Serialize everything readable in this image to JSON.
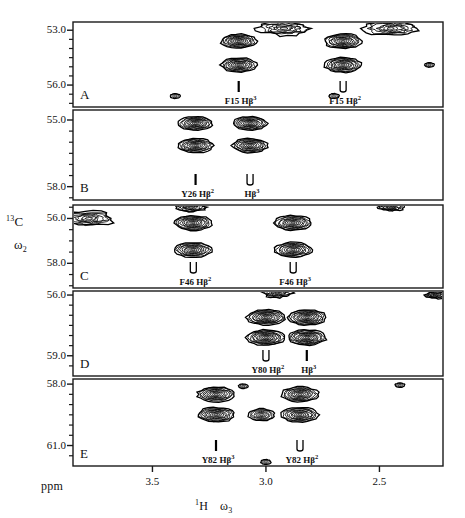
{
  "figure": {
    "type": "nmr-2d-contour-strips",
    "ppm_label": "ppm",
    "yaxis": {
      "nucleus": "13C",
      "omega": "2",
      "text_main": "C",
      "text_sup": "13",
      "text_omega": "ω",
      "text_omega_sub": "2"
    },
    "xaxis": {
      "nucleus": "1H",
      "omega": "3",
      "text_main": "H",
      "text_sup": "1",
      "text_omega": "ω",
      "text_omega_sub": "3",
      "ticks": [
        "3.5",
        "3.0",
        "2.5"
      ],
      "tick_ppm": [
        3.5,
        3.0,
        2.5
      ],
      "range_ppm": [
        3.85,
        2.22
      ]
    }
  },
  "panels": [
    {
      "letter": "A",
      "residue": "F15",
      "yticks": [
        "53.0",
        "56.0"
      ],
      "ylim": [
        "52.55",
        "57.2"
      ],
      "labels": [
        {
          "text_res": "F15",
          "text_h": "Hβ",
          "sup": "3",
          "marker": "single"
        },
        {
          "text_res": "F15",
          "text_h": "Hβ",
          "sup": "2",
          "marker": "double"
        }
      ]
    },
    {
      "letter": "B",
      "residue": "Y26",
      "yticks": [
        "55.0",
        "58.0"
      ],
      "ylim": [
        "54.55",
        "58.6"
      ],
      "labels": [
        {
          "text_res": "Y26",
          "text_h": "Hβ",
          "sup": "2",
          "marker": "single"
        },
        {
          "text_res": "",
          "text_h": "Hβ",
          "sup": "3",
          "marker": "double"
        }
      ]
    },
    {
      "letter": "C",
      "residue": "F46",
      "yticks": [
        "56.0",
        "58.0"
      ],
      "ylim": [
        "55.4",
        "59.1"
      ],
      "labels": [
        {
          "text_res": "F46",
          "text_h": "Hβ",
          "sup": "2",
          "marker": "double"
        },
        {
          "text_res": "F46",
          "text_h": "Hβ",
          "sup": "3",
          "marker": "double"
        }
      ]
    },
    {
      "letter": "D",
      "residue": "Y80",
      "yticks": [
        "56.0",
        "59.0"
      ],
      "ylim": [
        "55.8",
        "60.0"
      ],
      "labels": [
        {
          "text_res": "Y80",
          "text_h": "Hβ",
          "sup": "2",
          "marker": "double"
        },
        {
          "text_res": "",
          "text_h": "Hβ",
          "sup": "3",
          "marker": "single"
        }
      ]
    },
    {
      "letter": "E",
      "residue": "Y82",
      "yticks": [
        "58.0",
        "61.0"
      ],
      "ylim": [
        "57.75",
        "62.0"
      ],
      "labels": [
        {
          "text_res": "Y82",
          "text_h": "Hβ",
          "sup": "3",
          "marker": "single"
        },
        {
          "text_res": "Y82",
          "text_h": "Hβ",
          "sup": "2",
          "marker": "double"
        }
      ]
    }
  ],
  "chart_data": {
    "type": "contour",
    "title": "",
    "xlabel": "1H  ω3",
    "ylabel": "13C  ω2",
    "xlim_ppm": [
      3.85,
      2.22
    ],
    "xticks": [
      3.5,
      3.0,
      2.5
    ],
    "grid": false,
    "legend": "none",
    "panels": [
      {
        "letter": "A",
        "residue": "F15",
        "ylim_ppm": [
          52.55,
          57.2
        ],
        "yticks": [
          53.0,
          56.0
        ],
        "cross_peaks": [
          {
            "label": "F15 HB3",
            "h_ppm": 3.12,
            "c_ppm": 53.6,
            "intensity": 0.85
          },
          {
            "label": "F15 HB3",
            "h_ppm": 3.12,
            "c_ppm": 54.9,
            "intensity": 0.85
          },
          {
            "label": "F15 HB2",
            "h_ppm": 2.66,
            "c_ppm": 53.6,
            "intensity": 0.9
          },
          {
            "label": "F15 HB2",
            "h_ppm": 2.66,
            "c_ppm": 54.9,
            "intensity": 0.9
          },
          {
            "label": "artifact-streak",
            "h_ppm": 2.92,
            "c_ppm": 52.9,
            "intensity": 1.0
          },
          {
            "label": "artifact-streak",
            "h_ppm": 2.45,
            "c_ppm": 52.9,
            "intensity": 1.0
          },
          {
            "label": "weak",
            "h_ppm": 3.4,
            "c_ppm": 56.6,
            "intensity": 0.3
          },
          {
            "label": "weak",
            "h_ppm": 2.7,
            "c_ppm": 56.6,
            "intensity": 0.3
          },
          {
            "label": "weak-edge",
            "h_ppm": 2.28,
            "c_ppm": 54.9,
            "intensity": 0.25
          }
        ]
      },
      {
        "letter": "B",
        "residue": "Y26",
        "ylim_ppm": [
          54.55,
          58.6
        ],
        "yticks": [
          55.0,
          58.0
        ],
        "cross_peaks": [
          {
            "label": "Y26 HB2",
            "h_ppm": 3.31,
            "c_ppm": 55.15,
            "intensity": 0.8
          },
          {
            "label": "Y26 HB2",
            "h_ppm": 3.31,
            "c_ppm": 56.15,
            "intensity": 0.85
          },
          {
            "label": "Y26 HB3",
            "h_ppm": 3.07,
            "c_ppm": 55.15,
            "intensity": 0.8
          },
          {
            "label": "Y26 HB3",
            "h_ppm": 3.07,
            "c_ppm": 56.15,
            "intensity": 0.85
          }
        ]
      },
      {
        "letter": "C",
        "residue": "F46",
        "ylim_ppm": [
          55.4,
          59.1
        ],
        "yticks": [
          56.0,
          58.0
        ],
        "cross_peaks": [
          {
            "label": "F46 HB2",
            "h_ppm": 3.32,
            "c_ppm": 56.2,
            "intensity": 0.9
          },
          {
            "label": "F46 HB2",
            "h_ppm": 3.32,
            "c_ppm": 57.4,
            "intensity": 0.9
          },
          {
            "label": "F46 HB3",
            "h_ppm": 2.88,
            "c_ppm": 56.2,
            "intensity": 0.9
          },
          {
            "label": "F46 HB3",
            "h_ppm": 2.88,
            "c_ppm": 57.4,
            "intensity": 0.9
          },
          {
            "label": "artifact-edge",
            "h_ppm": 3.78,
            "c_ppm": 56.0,
            "intensity": 1.0
          },
          {
            "label": "artifact",
            "h_ppm": 3.33,
            "c_ppm": 55.5,
            "intensity": 0.5
          },
          {
            "label": "artifact",
            "h_ppm": 2.45,
            "c_ppm": 55.5,
            "intensity": 0.35
          }
        ]
      },
      {
        "letter": "D",
        "residue": "Y80",
        "ylim_ppm": [
          55.8,
          60.0
        ],
        "yticks": [
          56.0,
          59.0
        ],
        "cross_peaks": [
          {
            "label": "Y80 HB2",
            "h_ppm": 3.0,
            "c_ppm": 57.1,
            "intensity": 0.95
          },
          {
            "label": "Y80 HB2",
            "h_ppm": 3.0,
            "c_ppm": 58.1,
            "intensity": 0.95
          },
          {
            "label": "Y80 HB3",
            "h_ppm": 2.82,
            "c_ppm": 57.1,
            "intensity": 0.95
          },
          {
            "label": "Y80 HB3",
            "h_ppm": 2.82,
            "c_ppm": 58.1,
            "intensity": 0.95
          },
          {
            "label": "artifact-top",
            "h_ppm": 2.95,
            "c_ppm": 55.9,
            "intensity": 0.5
          },
          {
            "label": "artifact-edge",
            "h_ppm": 2.25,
            "c_ppm": 56.0,
            "intensity": 0.3
          }
        ]
      },
      {
        "letter": "E",
        "residue": "Y82",
        "ylim_ppm": [
          57.75,
          62.0
        ],
        "yticks": [
          58.0,
          61.0
        ],
        "cross_peaks": [
          {
            "label": "Y82 HB3",
            "h_ppm": 3.22,
            "c_ppm": 58.5,
            "intensity": 0.9
          },
          {
            "label": "Y82 HB3",
            "h_ppm": 3.22,
            "c_ppm": 59.5,
            "intensity": 0.9
          },
          {
            "label": "Y82 HB2",
            "h_ppm": 2.85,
            "c_ppm": 58.5,
            "intensity": 0.9
          },
          {
            "label": "Y82 HB2",
            "h_ppm": 2.85,
            "c_ppm": 59.5,
            "intensity": 0.9
          },
          {
            "label": "middle",
            "h_ppm": 3.02,
            "c_ppm": 59.5,
            "intensity": 0.7
          },
          {
            "label": "weak",
            "h_ppm": 3.1,
            "c_ppm": 58.1,
            "intensity": 0.25
          },
          {
            "label": "weak-edge",
            "h_ppm": 2.41,
            "c_ppm": 58.05,
            "intensity": 0.25
          },
          {
            "label": "weak-bottom",
            "h_ppm": 3.0,
            "c_ppm": 61.8,
            "intensity": 0.3
          }
        ]
      }
    ]
  }
}
